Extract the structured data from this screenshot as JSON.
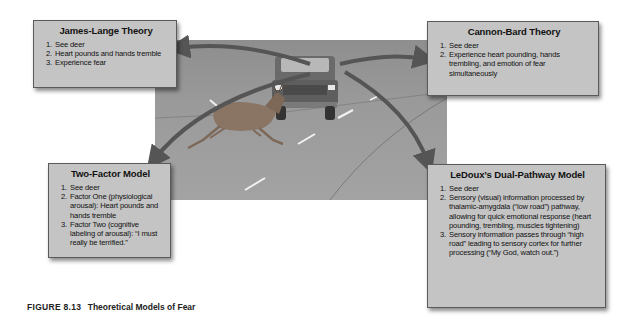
{
  "figure": {
    "number": "FIGURE 8.13",
    "title": "Theoretical Models of Fear"
  },
  "scene": {
    "description": "Deer leaping across a road in front of an oncoming truck",
    "objects": [
      "road",
      "truck",
      "deer"
    ]
  },
  "theories": {
    "james_lange": {
      "title": "James-Lange Theory",
      "steps": [
        "See deer",
        "Heart pounds and hands tremble",
        "Experience fear"
      ]
    },
    "cannon_bard": {
      "title": "Cannon-Bard Theory",
      "steps": [
        "See deer",
        "Experience heart pounding, hands trembling, and emotion of fear simultaneously"
      ]
    },
    "two_factor": {
      "title": "Two-Factor Model",
      "steps": [
        "See deer",
        "Factor One (physiological arousal): Heart pounds and hands tremble",
        "Factor Two (cognitive labeling of arousal): “I must really be terrified.”"
      ]
    },
    "ledoux": {
      "title": "LeDoux’s Dual-Pathway Model",
      "steps": [
        "See deer",
        "Sensory (visual) information processed by thalamic-amygdala (“low road”) pathway, allowing for quick emotional response (heart pounding, trembling, muscles tightening)",
        "Sensory information passes through “high road” leading to sensory cortex for further processing (“My God, watch out.”)"
      ]
    }
  },
  "colors": {
    "box_fill": "#c4c4c4",
    "arrow": "#555555",
    "road": "#9a9a9a"
  }
}
